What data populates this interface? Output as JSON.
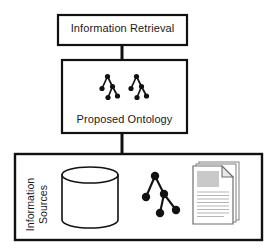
{
  "diagram": {
    "background_color": "#ffffff",
    "stroke_color": "#111111",
    "nodes": {
      "information_retrieval": {
        "label": "Information Retrieval",
        "shape": "rectangle",
        "x": 58,
        "y": 15,
        "width": 129,
        "height": 30
      },
      "proposed_ontology": {
        "label": "Proposed Ontology",
        "shape": "rectangle",
        "x": 62,
        "y": 60,
        "width": 125,
        "height": 73
      },
      "information_sources": {
        "label_line_1": "Information",
        "label_line_2": "Sources",
        "shape": "rectangle",
        "x": 15,
        "y": 154,
        "width": 247,
        "height": 86
      }
    },
    "connectors": [
      {
        "name": "retrieval-to-ontology",
        "from": "information_retrieval",
        "to": "proposed_ontology",
        "x": 122,
        "y1": 45,
        "y2": 60
      },
      {
        "name": "ontology-to-sources",
        "from": "proposed_ontology",
        "to": "information_sources",
        "x": 122,
        "y1": 133,
        "y2": 154
      }
    ],
    "icons": {
      "ontology_tree_left": {
        "name": "ontology-tree-icon",
        "node_radius": 2.6,
        "nodes": [
          {
            "id": "root",
            "x": 107.5,
            "y": 76.5
          },
          {
            "id": "child-left",
            "x": 102.0,
            "y": 88.5
          },
          {
            "id": "child-right",
            "x": 112.5,
            "y": 86.5
          },
          {
            "id": "leaf-left",
            "x": 108.0,
            "y": 97.5
          },
          {
            "id": "leaf-right",
            "x": 117.5,
            "y": 96.0
          }
        ],
        "edges": [
          [
            "root",
            "child-left"
          ],
          [
            "root",
            "child-right"
          ],
          [
            "child-right",
            "leaf-left"
          ],
          [
            "child-right",
            "leaf-right"
          ]
        ]
      },
      "ontology_tree_right": {
        "name": "ontology-tree-icon",
        "node_radius": 2.6,
        "nodes": [
          {
            "id": "root",
            "x": 136.5,
            "y": 76.5
          },
          {
            "id": "child-left",
            "x": 131.0,
            "y": 88.5
          },
          {
            "id": "child-right",
            "x": 141.5,
            "y": 86.5
          },
          {
            "id": "leaf-left",
            "x": 137.0,
            "y": 97.5
          },
          {
            "id": "leaf-right",
            "x": 146.5,
            "y": 96.0
          }
        ],
        "edges": [
          [
            "root",
            "child-left"
          ],
          [
            "root",
            "child-right"
          ],
          [
            "child-right",
            "leaf-left"
          ],
          [
            "child-right",
            "leaf-right"
          ]
        ]
      },
      "database_cylinder": {
        "name": "database-cylinder-icon",
        "x": 62,
        "y": 167,
        "width": 56,
        "height": 61,
        "ellipse_ry": 8
      },
      "source_tree": {
        "name": "source-tree-icon",
        "node_radius": 4.2,
        "nodes": [
          {
            "id": "root",
            "x": 155.0,
            "y": 176.0
          },
          {
            "id": "child-left",
            "x": 146.0,
            "y": 197.0
          },
          {
            "id": "child-right",
            "x": 164.0,
            "y": 194.0
          },
          {
            "id": "leaf-left",
            "x": 160.0,
            "y": 213.0
          },
          {
            "id": "leaf-right",
            "x": 176.0,
            "y": 210.0
          }
        ],
        "edges": [
          [
            "root",
            "child-left"
          ],
          [
            "root",
            "child-right"
          ],
          [
            "child-right",
            "leaf-left"
          ],
          [
            "child-right",
            "leaf-right"
          ]
        ]
      },
      "document_stack": {
        "name": "document-stack-icon",
        "x": 193,
        "y": 162,
        "width": 46,
        "height": 62,
        "sheet_count": 3,
        "fold_size": 11,
        "image_block_color": "#c9c9c9",
        "line_color": "#b4b4b4",
        "text_line_count": 11
      }
    }
  }
}
